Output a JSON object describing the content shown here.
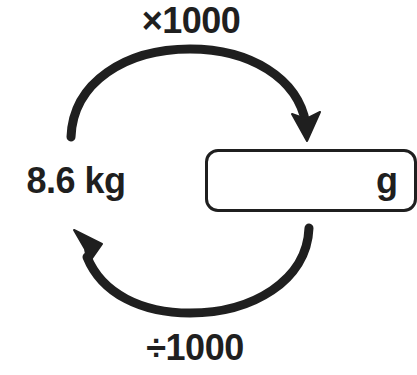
{
  "diagram": {
    "type": "unit-conversion-cycle",
    "source_quantity": {
      "value": "8.6",
      "unit": "kg",
      "label": "8.6 kg"
    },
    "target_quantity": {
      "value": "",
      "unit": "g",
      "placeholder": ""
    },
    "operations": {
      "forward": {
        "label": "×1000",
        "direction": "kg-to-g",
        "arrow": "clockwise-top"
      },
      "reverse": {
        "label": "÷1000",
        "direction": "g-to-kg",
        "arrow": "counterclockwise-bottom"
      }
    },
    "colors": {
      "ink": "#1f1f1f",
      "background": "#ffffff"
    },
    "icons": {
      "top_arrow": "curved-arrow-right-icon",
      "bottom_arrow": "curved-arrow-left-icon"
    }
  }
}
